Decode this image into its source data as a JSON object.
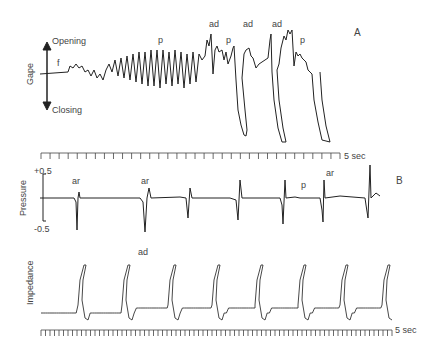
{
  "chart_data": [
    {
      "type": "line",
      "panel": "A",
      "title": "",
      "ylabel": "Gape",
      "y_direction_labels": {
        "up": "Opening",
        "down": "Closing"
      },
      "annotations": [
        "f",
        "p",
        "ad",
        "p",
        "ad",
        "ad",
        "p"
      ],
      "time_scale": "5 sec",
      "grid": false,
      "description": "Gape trace: small fluctuations (f), rhythmic oscillations of increasing amplitude (p), then large adductions (ad) with rapid closing."
    },
    {
      "type": "line",
      "panel": "B",
      "ylabel": "Pressure",
      "yticks": [
        "+0.5",
        "-0.5"
      ],
      "ylim": [
        -0.5,
        0.5
      ],
      "annotations": [
        "ar",
        "ar",
        "p",
        "ar"
      ],
      "time_scale": "5 sec",
      "grid": false,
      "description": "Pressure trace: baseline with sharp negative spikes at each adduction (ar)."
    },
    {
      "type": "line",
      "panel": "B",
      "ylabel": "Impedance",
      "annotations": [
        "ad"
      ],
      "time_scale": "5 sec",
      "grid": false,
      "description": "Impedance trace: small sawtooth oscillations interrupted by 8 large sharp peaks (adductions)."
    }
  ],
  "labels": {
    "panel_a": "A",
    "panel_b": "B",
    "opening": "Opening",
    "closing": "Closing",
    "gape": "Gape",
    "f": "f",
    "p1": "p",
    "ad1": "ad",
    "p2": "p",
    "ad2": "ad",
    "ad3": "ad",
    "p3": "p",
    "scale_a": "5 sec",
    "pressure": "Pressure",
    "plus": "+0.5",
    "minus": "-0.5",
    "ar1": "ar",
    "ar2": "ar",
    "p4": "p",
    "ar3": "ar",
    "impedance": "Impedance",
    "ad4": "ad",
    "scale_b": "5 sec"
  }
}
